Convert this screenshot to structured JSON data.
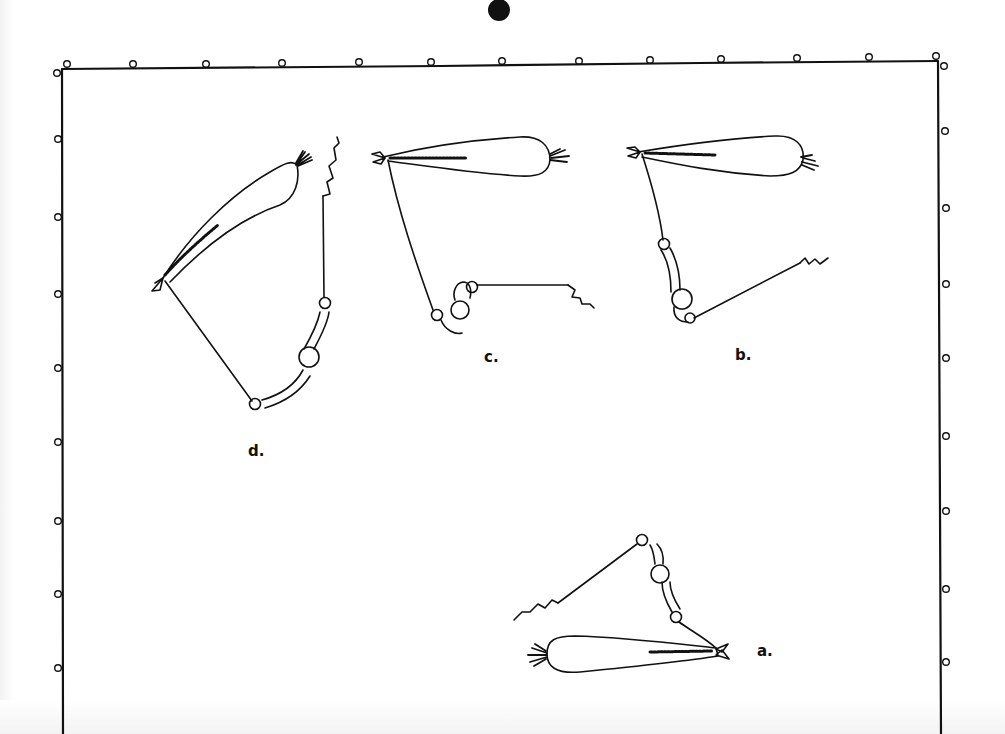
{
  "figure": {
    "panels": [
      {
        "id": "d",
        "label": "d.",
        "label_pos": [
          248,
          444
        ]
      },
      {
        "id": "c",
        "label": "c.",
        "label_pos": [
          484,
          350
        ]
      },
      {
        "id": "b",
        "label": "b.",
        "label_pos": [
          735,
          348
        ]
      },
      {
        "id": "a",
        "label": "a.",
        "label_pos": [
          757,
          644
        ]
      }
    ],
    "colors": {
      "ink": "#111111",
      "paper": "#ffffff"
    },
    "border": {
      "top_markers": 14,
      "left_markers": 8,
      "right_markers": 9
    }
  }
}
